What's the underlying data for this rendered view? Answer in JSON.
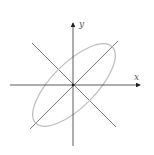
{
  "diagram": {
    "axes": {
      "x_label": "x",
      "y_label": "y"
    },
    "colors": {
      "axis": "#333333",
      "ellipse": "#b8b8b8",
      "lines": "#555555"
    }
  }
}
